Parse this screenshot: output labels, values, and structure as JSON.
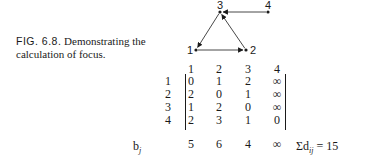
{
  "caption": {
    "figure_label": "FIG. 6.8.",
    "text": "Demonstrating the calculation of focus."
  },
  "graph": {
    "nodes": [
      {
        "id": "1",
        "x": 10,
        "y": 50
      },
      {
        "id": "2",
        "x": 60,
        "y": 50
      },
      {
        "id": "3",
        "x": 34,
        "y": 12
      },
      {
        "id": "4",
        "x": 82,
        "y": 12
      }
    ],
    "edges": [
      {
        "from": "4",
        "to": "3"
      },
      {
        "from": "3",
        "to": "1"
      },
      {
        "from": "1",
        "to": "2"
      },
      {
        "from": "2",
        "to": "3"
      }
    ]
  },
  "matrix": {
    "column_headers": [
      "1",
      "2",
      "3",
      "4"
    ],
    "row_headers": [
      "1",
      "2",
      "3",
      "4"
    ],
    "rows": [
      [
        "0",
        "1",
        "2",
        "∞"
      ],
      [
        "2",
        "0",
        "1",
        "∞"
      ],
      [
        "1",
        "2",
        "0",
        "∞"
      ],
      [
        "2",
        "3",
        "1",
        "0"
      ]
    ],
    "column_sums_label": "b",
    "column_sums_label_sub": "j",
    "column_sums": [
      "5",
      "6",
      "4",
      "∞"
    ],
    "total": "Σd",
    "total_sub": "ij",
    "total_value": " = 15"
  }
}
